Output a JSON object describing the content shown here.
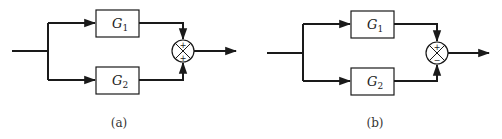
{
  "diagrams": [
    {
      "id": "a",
      "caption": "(a)",
      "blocks": [
        {
          "name": "G",
          "subscript": "1"
        },
        {
          "name": "G",
          "subscript": "2"
        }
      ],
      "summing_junction": {
        "top_sign": "+",
        "bottom_sign": "+"
      },
      "description": "Parallel connection: G1 and G2 outputs added"
    },
    {
      "id": "b",
      "caption": "(b)",
      "blocks": [
        {
          "name": "G",
          "subscript": "1"
        },
        {
          "name": "G",
          "subscript": "2"
        }
      ],
      "summing_junction": {
        "top_sign": "+",
        "bottom_sign": "−"
      },
      "description": "Parallel connection: G2 output subtracted from G1 output"
    }
  ],
  "colors": {
    "line": "#1a1a1a",
    "background": "#ffffff"
  }
}
